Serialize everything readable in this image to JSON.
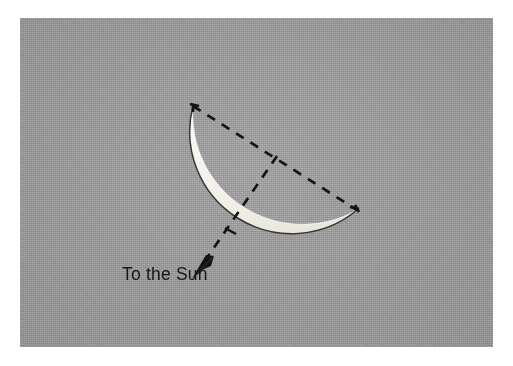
{
  "figure": {
    "caption": "To the Sun",
    "background_color": "#9b9b9b",
    "border_color": "#ffffff",
    "ink_color": "#121212",
    "lit_limb_color": "#f2f0e8",
    "elements": {
      "moon_disc_label": "moon-disc-arc",
      "lit_crescent_label": "lit-crescent",
      "chord_label": "terminator-chord-dashed",
      "sun_line_label": "sun-direction-dashed",
      "arrow_label": "sun-direction-arrow"
    },
    "geometry": {
      "chord_start": [
        193,
        106
      ],
      "chord_end": [
        357,
        210
      ],
      "chord_midpoint": [
        277,
        159
      ],
      "arrow_tip": [
        193,
        278
      ],
      "arc_sagitta_direction": "down-left",
      "dash_pattern": "9 8",
      "dash_width": 2.6
    }
  }
}
